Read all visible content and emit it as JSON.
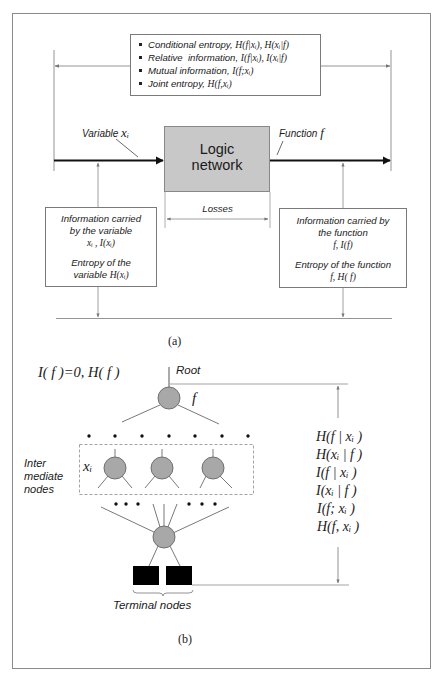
{
  "figure_a": {
    "metrics_box": {
      "items": [
        {
          "label": "Conditional entropy, ",
          "math": "H(f|xᵢ), H(xᵢ|f)"
        },
        {
          "label": "Relative  information, ",
          "math": "I(f|xᵢ), I(xᵢ|f)"
        },
        {
          "label": "Mutual information, ",
          "math": " I(f;xᵢ)"
        },
        {
          "label": "Joint entropy, ",
          "math": "H(f,xᵢ)"
        }
      ]
    },
    "variable_label": "Variable ",
    "variable_symbol": "xᵢ",
    "function_label": "Function ",
    "function_symbol": "f",
    "logic_box": {
      "line1": "Logic",
      "line2": "network",
      "fill": "#c8c8c8"
    },
    "losses_label": "Losses",
    "left_info": {
      "line1": "Information carried",
      "line2": "by the variable",
      "math1": "xᵢ , I(xᵢ)",
      "line3": "Entropy of the",
      "line4": "variable ",
      "math2": "H(xᵢ)"
    },
    "right_info": {
      "line1": "Information carried by",
      "line2": "the function",
      "math1": "f, I(f)",
      "line3": "Entropy of the function",
      "math2": "f, H( f)"
    },
    "caption": "(a)"
  },
  "figure_b": {
    "root_measure": "I( f )=0, H( f )",
    "root_label": "Root",
    "root_symbol": "f",
    "intermediate_label": [
      "Inter",
      "mediate",
      "nodes"
    ],
    "intermediate_symbol": "xᵢ",
    "terminal_label": "Terminal nodes",
    "measures": [
      "H(f | xᵢ )",
      "H(xᵢ | f )",
      "I(f | xᵢ )",
      "I(xᵢ | f )",
      "I(f; xᵢ )",
      "H(f, xᵢ )"
    ],
    "node_fill": "#a8a8a8",
    "caption": "(b)"
  }
}
